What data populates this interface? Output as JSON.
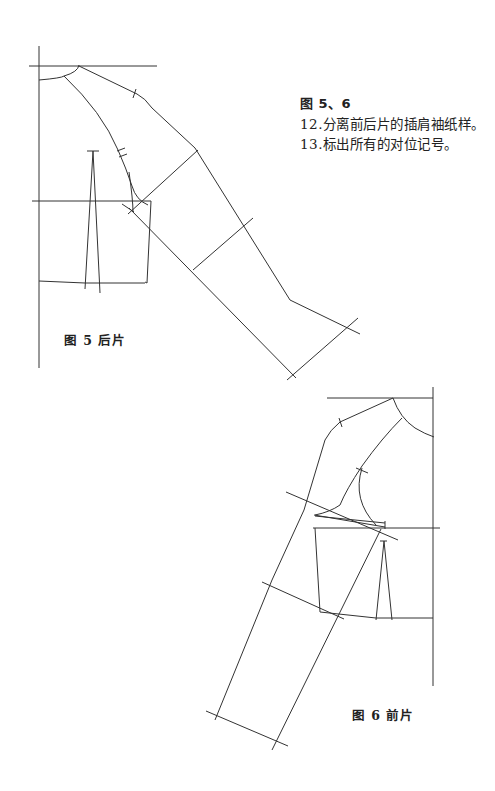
{
  "notes": {
    "title": "图 5、6",
    "items": [
      "12.分离前后片的插肩袖纸样。",
      "13.标出所有的对位记号。"
    ]
  },
  "figures": [
    {
      "id": "fig5",
      "caption": "图 5  后片",
      "subject": "back piece raglan sleeve pattern"
    },
    {
      "id": "fig6",
      "caption": "图 6  前片",
      "subject": "front piece raglan sleeve pattern"
    }
  ]
}
